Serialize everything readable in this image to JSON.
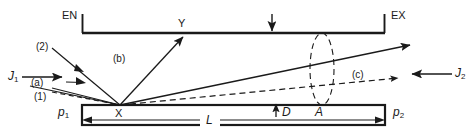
{
  "figure": {
    "type": "physics-schematic",
    "title_visible": false
  },
  "colors": {
    "line": "#1a1a1a",
    "background": "#ffffff",
    "text": "#1a1a1a"
  },
  "labels": {
    "entrance": "EN",
    "exit": "EX",
    "flux_left": "J",
    "flux_left_sub": "1",
    "flux_right": "J",
    "flux_right_sub": "2",
    "pressure_left": "p",
    "pressure_left_sub": "1",
    "pressure_right": "p",
    "pressure_right_sub": "2",
    "ray_1": "(1)",
    "ray_2": "(2)",
    "ray_a": "(a)",
    "ray_b": "(b)",
    "ray_c": "(c)",
    "point_x": "X",
    "point_y": "Y",
    "length": "L",
    "gap": "D",
    "area": "A"
  },
  "geometry": {
    "top_plate": {
      "x1": 82,
      "y1": 33,
      "x2": 385,
      "y2": 33
    },
    "bottom_plate": {
      "x1": 82,
      "y1": 105,
      "x2": 385,
      "y2": 125
    },
    "point_x": {
      "x": 120,
      "y": 105
    },
    "point_y": {
      "x": 183,
      "y": 33
    },
    "length_L": 303,
    "aperture_ellipse": {
      "cx": 322,
      "cy": 69,
      "rx": 12,
      "ry": 36
    }
  }
}
